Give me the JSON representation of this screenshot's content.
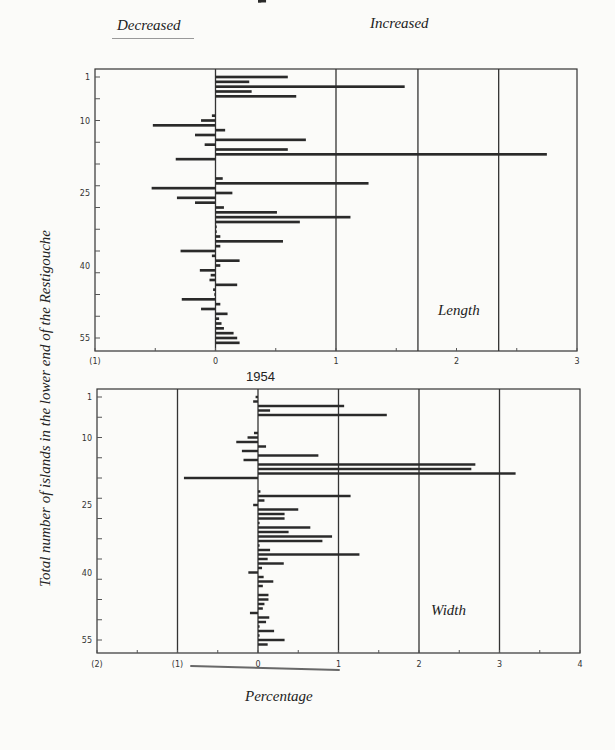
{
  "header": {
    "left_label": "Decreased",
    "right_label": "Increased"
  },
  "y_axis_title": "Total number of islands in the lower end of the Restigouche",
  "x_axis_title": "Percentage",
  "year_label": "1954",
  "chart_data": [
    {
      "type": "bar",
      "orientation": "horizontal",
      "title": "Length",
      "xlabel": "Percentage",
      "ylabel": "Total number of islands in the lower end of the Restigouche",
      "xlim": [
        -1,
        3
      ],
      "x_ticks": [
        "(1)",
        "0",
        "1",
        "2",
        "3"
      ],
      "x_tick_values": [
        -1,
        0,
        1,
        2,
        3
      ],
      "reference_lines": [
        0,
        1,
        1.68,
        2.35
      ],
      "ylim": [
        1,
        56
      ],
      "y_ticks": [
        "1",
        "10",
        "25",
        "40",
        "55"
      ],
      "y_tick_values": [
        1,
        10,
        25,
        40,
        55
      ],
      "grid": false,
      "categories": [
        1,
        2,
        3,
        4,
        5,
        6,
        7,
        8,
        9,
        10,
        11,
        12,
        13,
        14,
        15,
        16,
        17,
        18,
        19,
        20,
        21,
        22,
        23,
        24,
        25,
        26,
        27,
        28,
        29,
        30,
        31,
        32,
        33,
        34,
        35,
        36,
        37,
        38,
        39,
        40,
        41,
        42,
        43,
        44,
        45,
        46,
        47,
        48,
        49,
        50,
        51,
        52,
        53,
        54,
        55,
        56
      ],
      "values": [
        0.6,
        0.28,
        1.57,
        0.3,
        0.67,
        0,
        0,
        0,
        -0.03,
        -0.12,
        -0.52,
        0.08,
        -0.17,
        0.75,
        -0.09,
        0.6,
        2.75,
        -0.33,
        0,
        0,
        0,
        0.06,
        1.27,
        -0.53,
        0.14,
        -0.32,
        -0.17,
        0.07,
        0.51,
        1.12,
        0.7,
        0.01,
        0.01,
        0.04,
        0.56,
        0.04,
        -0.29,
        -0.03,
        0.2,
        0.04,
        -0.13,
        -0.04,
        -0.05,
        0.18,
        -0.02,
        -0.01,
        -0.28,
        0.04,
        -0.12,
        0.1,
        0.03,
        0.05,
        0.07,
        0.15,
        0.18,
        0.2
      ],
      "annotation": "Length"
    },
    {
      "type": "bar",
      "orientation": "horizontal",
      "title": "Width",
      "subtitle": "1954",
      "xlabel": "Percentage",
      "ylabel": "Total number of islands in the lower end of the Restigouche",
      "xlim": [
        -2,
        4
      ],
      "x_ticks": [
        "(2)",
        "(1)",
        "0",
        "1",
        "2",
        "3",
        "4"
      ],
      "x_tick_values": [
        -2,
        -1,
        0,
        1,
        2,
        3,
        4
      ],
      "reference_lines": [
        -1,
        0,
        1,
        2,
        3
      ],
      "ylim": [
        1,
        56
      ],
      "y_ticks": [
        "1",
        "10",
        "25",
        "40",
        "55"
      ],
      "y_tick_values": [
        1,
        10,
        25,
        40,
        55
      ],
      "grid": false,
      "categories": [
        1,
        2,
        3,
        4,
        5,
        6,
        7,
        8,
        9,
        10,
        11,
        12,
        13,
        14,
        15,
        16,
        17,
        18,
        19,
        20,
        21,
        22,
        23,
        24,
        25,
        26,
        27,
        28,
        29,
        30,
        31,
        32,
        33,
        34,
        35,
        36,
        37,
        38,
        39,
        40,
        41,
        42,
        43,
        44,
        45,
        46,
        47,
        48,
        49,
        50,
        51,
        52,
        53,
        54,
        55,
        56
      ],
      "values": [
        -0.03,
        -0.06,
        1.07,
        0.15,
        1.6,
        0,
        0,
        0,
        -0.05,
        -0.13,
        -0.27,
        0.1,
        -0.2,
        0.75,
        -0.18,
        2.7,
        2.65,
        3.2,
        -0.92,
        0,
        0,
        0.03,
        1.15,
        0.08,
        -0.06,
        0.5,
        0.33,
        0.33,
        0.02,
        0.65,
        0.38,
        0.92,
        0.8,
        0.02,
        0.15,
        1.26,
        0.12,
        0.32,
        0.05,
        -0.12,
        0.07,
        0.19,
        0.06,
        0,
        0.13,
        0.13,
        0.08,
        0.06,
        -0.1,
        0.14,
        0.1,
        0.02,
        0.2,
        0.02,
        0.33,
        0.12,
        0.1,
        0.04
      ],
      "annotation": "Width"
    }
  ]
}
